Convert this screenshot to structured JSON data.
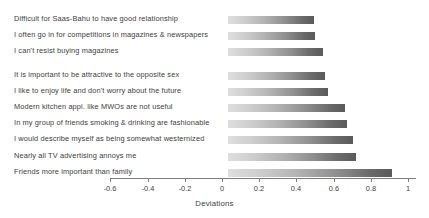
{
  "chart_data": {
    "type": "bar",
    "orientation": "horizontal",
    "title": "",
    "xlabel": "Deviations",
    "ylabel": "",
    "xlim": [
      -0.7,
      1.0
    ],
    "xticks": [
      -0.6,
      -0.4,
      -0.2,
      0,
      0.2,
      0.4,
      0.6,
      0.8,
      1
    ],
    "xticklabels": [
      "-0.6",
      "-0.4",
      "-0.2",
      "0",
      "0.2",
      "0.4",
      "0.6",
      "0.8",
      "1"
    ],
    "grid": false,
    "legend": null,
    "categories": [
      "Difficult for  Saas-Bahu to have good  relationship",
      "I often go in for competitions in magazines & newspapers",
      "I can't resist buying magazines",
      "It is important to be attractive to the opposite sex",
      "I like to enjoy life and don't worry about the future",
      "Modern kitchen appl. like MWOs are not  useful",
      "In my group of friends smoking & drinking are fashionable",
      "I would describe myself as being somewhat westernized",
      "Nearly all TV advertising annoys me",
      "Friends more important than family"
    ],
    "values": [
      0.46,
      0.47,
      0.51,
      0.52,
      0.54,
      0.63,
      0.64,
      0.67,
      0.69,
      0.88
    ],
    "bar_style": {
      "fill": "gradient",
      "gradient_from": "#dedede",
      "gradient_to": "#5a5a5a"
    }
  },
  "axis": {
    "line_color": "#7d7d7d",
    "title": "Deviations"
  }
}
